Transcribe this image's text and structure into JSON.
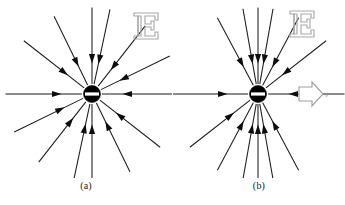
{
  "figure": {
    "background_color": "#ffffff",
    "line_color": "#1b1b1b",
    "charge_color": "#000000",
    "annotation_color": "#a8a8a8",
    "width": 345,
    "height": 205
  },
  "panels": [
    {
      "id": "a",
      "caption": "(a)",
      "charge": {
        "sign_label": "−",
        "sign_name": "minus-sign",
        "polarity": "negative",
        "center_x": 92,
        "center_y": 94,
        "radius": 8.5
      },
      "field": {
        "symbol": "E",
        "symbol_name": "electric-field-label",
        "direction": "inward",
        "line_count": 14,
        "distribution": "isotropic",
        "angles_deg": [
          0,
          26,
          52,
          78,
          90,
          116,
          142,
          180,
          206,
          232,
          258,
          270,
          296,
          322
        ],
        "line_length": 78
      },
      "velocity": null
    },
    {
      "id": "b",
      "caption": "(b)",
      "charge": {
        "sign_label": "−",
        "sign_name": "minus-sign",
        "polarity": "negative",
        "center_x": 85,
        "center_y": 94,
        "radius": 8.5
      },
      "field": {
        "symbol": "E",
        "symbol_name": "electric-field-label",
        "direction": "inward",
        "line_count": 14,
        "distribution": "compressed-transverse",
        "angles_deg": [
          0,
          38,
          62,
          80,
          90,
          100,
          118,
          180,
          218,
          242,
          260,
          270,
          280,
          298
        ],
        "line_length": 78
      },
      "velocity": {
        "symbol": "v",
        "symbol_name": "velocity-label",
        "direction": "right",
        "arrow_name": "velocity-arrow"
      }
    }
  ]
}
